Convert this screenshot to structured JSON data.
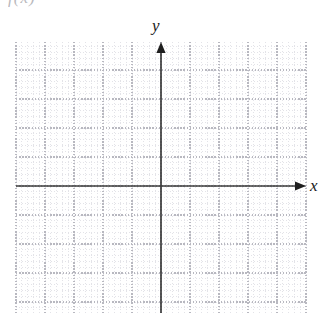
{
  "page": {
    "width": 324,
    "height": 327,
    "background": "#ffffff",
    "clipped_caption": "f(x)"
  },
  "axis_labels": {
    "y": "y",
    "x": "x"
  },
  "chart_data": {
    "type": "scatter",
    "title": "",
    "subtitle": "",
    "xlabel": "x",
    "ylabel": "y",
    "series": [],
    "x": [],
    "values": [],
    "categories": [],
    "annotations": [],
    "legend": [],
    "legend_position": "none",
    "grid": true,
    "xlim": [
      -5,
      5
    ],
    "ylim": [
      -4.4,
      5
    ],
    "major_step": 1,
    "minor_per_major": 5,
    "origin_px": {
      "x": 145,
      "y": 144
    },
    "major_spacing_px": 29,
    "minor_spacing_px": 5.8,
    "plot_rect_px": {
      "left": 16,
      "top": 42,
      "width": 290,
      "height": 271
    },
    "axes": {
      "x_axis": {
        "arrow_end": "right",
        "color": "#3d3d3d"
      },
      "y_axis": {
        "arrow_end": "top",
        "color": "#3d3d3d"
      }
    },
    "colors": {
      "minor_grid": "#dcdce2",
      "major_grid": "#b8b8c0",
      "axis": "#3d3d3d",
      "label": "#1a1a1a"
    }
  }
}
